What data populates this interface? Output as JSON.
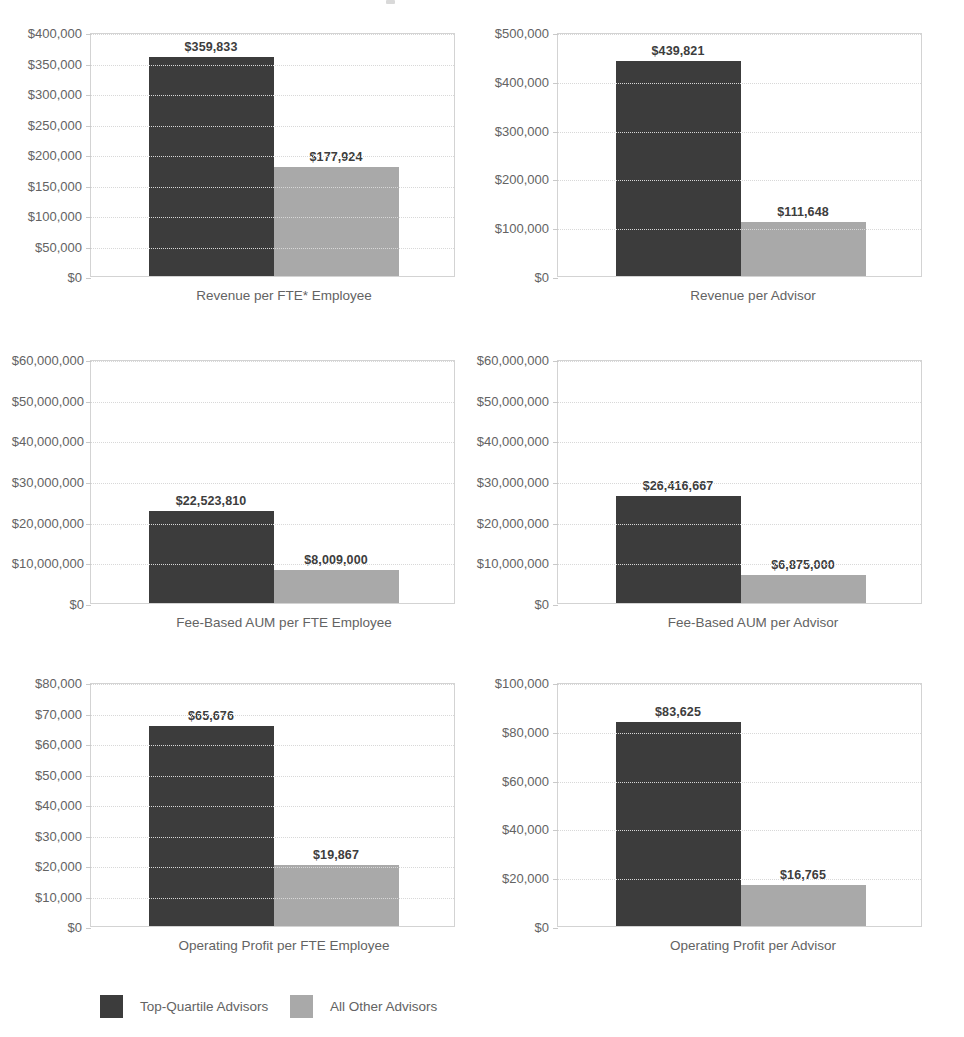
{
  "legend": {
    "items": [
      {
        "label": "Top-Quartile Advisors",
        "color": "#3c3c3c",
        "key": "top_quartile"
      },
      {
        "label": "All Other Advisors",
        "color": "#a9a9a9",
        "key": "all_other"
      }
    ]
  },
  "colors": {
    "top_quartile": "#3c3c3c",
    "all_other": "#a9a9a9",
    "axis_text": "#636363",
    "gridline": "#d8d8d8",
    "plot_border": "#d3d3d3",
    "background": "#ffffff"
  },
  "chart_data": [
    {
      "id": "revenue-per-fte-employee",
      "type": "bar",
      "title": "",
      "xlabel": "Revenue per FTE* Employee",
      "ylabel": "",
      "categories": [
        "Top-Quartile Advisors",
        "All Other Advisors"
      ],
      "values": [
        359833,
        177924
      ],
      "value_labels": [
        "$359,833",
        "$177,924"
      ],
      "ylim": [
        0,
        400000
      ],
      "ytick_values": [
        0,
        50000,
        100000,
        150000,
        200000,
        250000,
        300000,
        350000,
        400000
      ],
      "ytick_labels": [
        "$0",
        "$50,000",
        "$100,000",
        "$150,000",
        "$200,000",
        "$250,000",
        "$300,000",
        "$350,000",
        "$400,000"
      ],
      "grid": true,
      "legend_position": "bottom"
    },
    {
      "id": "revenue-per-advisor",
      "type": "bar",
      "title": "",
      "xlabel": "Revenue per Advisor",
      "ylabel": "",
      "categories": [
        "Top-Quartile Advisors",
        "All Other Advisors"
      ],
      "values": [
        439821,
        111648
      ],
      "value_labels": [
        "$439,821",
        "$111,648"
      ],
      "ylim": [
        0,
        500000
      ],
      "ytick_values": [
        0,
        100000,
        200000,
        300000,
        400000,
        500000
      ],
      "ytick_labels": [
        "$0",
        "$100,000",
        "$200,000",
        "$300,000",
        "$400,000",
        "$500,000"
      ],
      "grid": true,
      "legend_position": "bottom"
    },
    {
      "id": "fee-based-aum-per-fte-employee",
      "type": "bar",
      "title": "",
      "xlabel": "Fee-Based AUM per FTE Employee",
      "ylabel": "",
      "categories": [
        "Top-Quartile Advisors",
        "All Other Advisors"
      ],
      "values": [
        22523810,
        8009000
      ],
      "value_labels": [
        "$22,523,810",
        "$8,009,000"
      ],
      "ylim": [
        0,
        60000000
      ],
      "ytick_values": [
        0,
        10000000,
        20000000,
        30000000,
        40000000,
        50000000,
        60000000
      ],
      "ytick_labels": [
        "$0",
        "$10,000,000",
        "$20,000,000",
        "$30,000,000",
        "$40,000,000",
        "$50,000,000",
        "$60,000,000"
      ],
      "grid": true,
      "legend_position": "bottom"
    },
    {
      "id": "fee-based-aum-per-advisor",
      "type": "bar",
      "title": "",
      "xlabel": "Fee-Based AUM per Advisor",
      "ylabel": "",
      "categories": [
        "Top-Quartile Advisors",
        "All Other Advisors"
      ],
      "values": [
        26416667,
        6875000
      ],
      "value_labels": [
        "$26,416,667",
        "$6,875,000"
      ],
      "ylim": [
        0,
        60000000
      ],
      "ytick_values": [
        0,
        10000000,
        20000000,
        30000000,
        40000000,
        50000000,
        60000000
      ],
      "ytick_labels": [
        "$0",
        "$10,000,000",
        "$20,000,000",
        "$30,000,000",
        "$40,000,000",
        "$50,000,000",
        "$60,000,000"
      ],
      "grid": true,
      "legend_position": "bottom"
    },
    {
      "id": "operating-profit-per-fte-employee",
      "type": "bar",
      "title": "",
      "xlabel": "Operating Profit per FTE Employee",
      "ylabel": "",
      "categories": [
        "Top-Quartile Advisors",
        "All Other Advisors"
      ],
      "values": [
        65676,
        19867
      ],
      "value_labels": [
        "$65,676",
        "$19,867"
      ],
      "ylim": [
        0,
        80000
      ],
      "ytick_values": [
        0,
        10000,
        20000,
        30000,
        40000,
        50000,
        60000,
        70000,
        80000
      ],
      "ytick_labels": [
        "$0",
        "$10,000",
        "$20,000",
        "$30,000",
        "$40,000",
        "$50,000",
        "$60,000",
        "$70,000",
        "$80,000"
      ],
      "grid": true,
      "legend_position": "bottom"
    },
    {
      "id": "operating-profit-per-advisor",
      "type": "bar",
      "title": "",
      "xlabel": "Operating Profit per Advisor",
      "ylabel": "",
      "categories": [
        "Top-Quartile Advisors",
        "All Other Advisors"
      ],
      "values": [
        83625,
        16765
      ],
      "value_labels": [
        "$83,625",
        "$16,765"
      ],
      "ylim": [
        0,
        100000
      ],
      "ytick_values": [
        0,
        20000,
        40000,
        60000,
        80000,
        100000
      ],
      "ytick_labels": [
        "$0",
        "$20,000",
        "$40,000",
        "$60,000",
        "$80,000",
        "$100,000"
      ],
      "grid": true,
      "legend_position": "bottom"
    }
  ]
}
